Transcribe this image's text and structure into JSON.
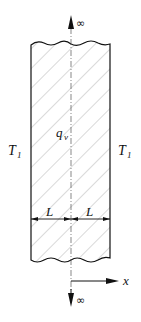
{
  "diagram": {
    "labels": {
      "top_infinity": "∞",
      "bottom_infinity": "∞",
      "heat_generation": "q",
      "heat_generation_sub": "v",
      "left_temp": "T",
      "left_temp_sub": "1",
      "right_temp": "T",
      "right_temp_sub": "1",
      "left_half_width": "L",
      "right_half_width": "L",
      "x_axis": "x"
    },
    "colors": {
      "stroke": "#111111",
      "hatch": "#9a9a9a",
      "centerline": "#555555",
      "background": "#ffffff"
    }
  }
}
